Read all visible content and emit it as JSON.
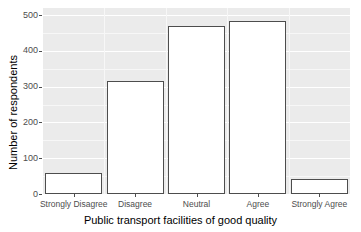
{
  "chart_data": {
    "type": "bar",
    "title": "",
    "xlabel": "Public transport facilities of good quality",
    "ylabel": "Number of respondents",
    "categories": [
      "Strongly Disagree",
      "Disagree",
      "Neutral",
      "Agree",
      "Strongly Agree"
    ],
    "values": [
      59,
      316,
      469,
      485,
      42
    ],
    "ylim": [
      0,
      520
    ],
    "yticks": [
      0,
      100,
      200,
      300,
      400,
      500
    ],
    "ytick_labels": [
      "0",
      "100",
      "200",
      "300",
      "400",
      "500"
    ],
    "grid": true,
    "legend": "none",
    "bar_fill_color": "#ffffff",
    "bar_border_color": "#4d4d4d",
    "panel_background_color": "#ebebeb",
    "gridline_color": "#ffffff",
    "axis_text_color": "#4d4d4d"
  }
}
